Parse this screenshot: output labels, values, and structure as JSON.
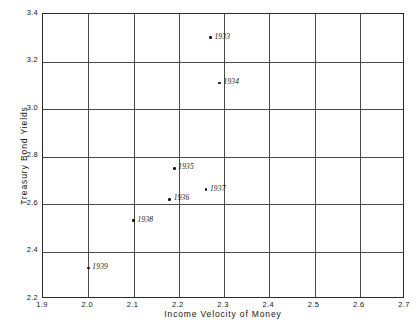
{
  "chart_data": {
    "type": "scatter",
    "title": "",
    "xlabel": "Income Velocity of Money",
    "ylabel": "Treasury Bond Yields",
    "xlim": [
      1.9,
      2.7
    ],
    "ylim": [
      2.2,
      3.4
    ],
    "xticks": [
      "1.9",
      "2.0",
      "2.1",
      "2.2",
      "2.3",
      "2.4",
      "2.5",
      "2.6",
      "2.7"
    ],
    "yticks": [
      "2.2",
      "2.4",
      "2.6",
      "2.8",
      "3.0",
      "3.2",
      "3.4"
    ],
    "grid": true,
    "legend": "none",
    "points": [
      {
        "label": "1933",
        "x": 2.27,
        "y": 3.3
      },
      {
        "label": "1934",
        "x": 2.29,
        "y": 3.11
      },
      {
        "label": "1935",
        "x": 2.19,
        "y": 2.75
      },
      {
        "label": "1936",
        "x": 2.18,
        "y": 2.62
      },
      {
        "label": "1937",
        "x": 2.26,
        "y": 2.66
      },
      {
        "label": "1938",
        "x": 2.1,
        "y": 2.53
      },
      {
        "label": "1939",
        "x": 2.0,
        "y": 2.33
      }
    ]
  }
}
